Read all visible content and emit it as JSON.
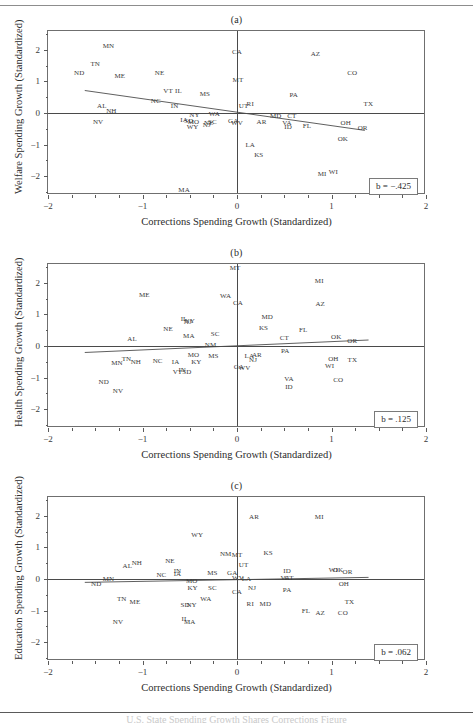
{
  "figure": {
    "x_axis_title": "Corrections Spending Growth (Standardized)",
    "x_ticks": [
      "-2",
      "-1",
      "0",
      "1",
      "2"
    ],
    "y_ticks": [
      "2",
      "1",
      "0",
      "-1",
      "-2"
    ],
    "footer_text": "U.S. State Spending Growth Shares Corrections Figure"
  },
  "chart_data": [
    {
      "type": "scatter",
      "panel": "a",
      "title": "(a)",
      "xlabel": "Corrections Spending Growth (Standardized)",
      "ylabel": "Welfare Spending Growth (Standardized)",
      "xlim": [
        -2,
        2
      ],
      "ylim": [
        -2.6,
        2.6
      ],
      "grid": false,
      "annotation": "b = -.425",
      "slope": -0.425,
      "intercept": -0.09,
      "fit_x": [
        -1.62,
        1.38
      ],
      "fit_y": [
        0.69,
        -0.59
      ],
      "point_labels": [
        "MN",
        "TN",
        "ND",
        "ME",
        "NE",
        "CA",
        "AZ",
        "CO",
        "MT",
        "VT",
        "IL",
        "MS",
        "PA",
        "TX",
        "NC",
        "UT",
        "RI",
        "AL",
        "IN",
        "NH",
        "NY",
        "WA",
        "MD",
        "CT",
        "NV",
        "IA",
        "SD",
        "MO",
        "NE2",
        "SC",
        "GA",
        "WV",
        "AR",
        "VA",
        "ID",
        "FL",
        "OH",
        "OR",
        "WY",
        "NJ",
        "OK",
        "LA",
        "KS",
        "MI",
        "WI",
        "MA"
      ],
      "points": [
        {
          "label": "MN",
          "x": -1.36,
          "y": 2.13
        },
        {
          "label": "TN",
          "x": -1.5,
          "y": 1.55
        },
        {
          "label": "ND",
          "x": -1.67,
          "y": 1.28
        },
        {
          "label": "ME",
          "x": -1.24,
          "y": 1.18
        },
        {
          "label": "NE",
          "x": -0.82,
          "y": 1.26
        },
        {
          "label": "CA",
          "x": 0.0,
          "y": 1.92
        },
        {
          "label": "AZ",
          "x": 0.83,
          "y": 1.88
        },
        {
          "label": "CO",
          "x": 1.22,
          "y": 1.28
        },
        {
          "label": "MT",
          "x": 0.01,
          "y": 1.06
        },
        {
          "label": "VT",
          "x": -0.73,
          "y": 0.7
        },
        {
          "label": "IL",
          "x": -0.62,
          "y": 0.7
        },
        {
          "label": "MS",
          "x": -0.34,
          "y": 0.6
        },
        {
          "label": "PA",
          "x": 0.6,
          "y": 0.56
        },
        {
          "label": "TX",
          "x": 1.39,
          "y": 0.28
        },
        {
          "label": "NC",
          "x": -0.86,
          "y": 0.37
        },
        {
          "label": "UT",
          "x": 0.07,
          "y": 0.22
        },
        {
          "label": "RI",
          "x": 0.14,
          "y": 0.27
        },
        {
          "label": "AL",
          "x": -1.43,
          "y": 0.21
        },
        {
          "label": "IN",
          "x": -0.66,
          "y": 0.23
        },
        {
          "label": "NH",
          "x": -1.33,
          "y": 0.06
        },
        {
          "label": "NY",
          "x": -0.45,
          "y": -0.05
        },
        {
          "label": "WA",
          "x": -0.24,
          "y": -0.02
        },
        {
          "label": "MD",
          "x": 0.41,
          "y": -0.08
        },
        {
          "label": "CT",
          "x": 0.58,
          "y": -0.09
        },
        {
          "label": "NV",
          "x": -1.47,
          "y": -0.29
        },
        {
          "label": "IA",
          "x": -0.56,
          "y": -0.22
        },
        {
          "label": "SD",
          "x": -0.51,
          "y": -0.26
        },
        {
          "label": "MO",
          "x": -0.46,
          "y": -0.27
        },
        {
          "label": "NE2",
          "x": -0.3,
          "y": -0.31
        },
        {
          "label": "SC",
          "x": -0.26,
          "y": -0.28
        },
        {
          "label": "GA",
          "x": -0.04,
          "y": -0.25
        },
        {
          "label": "WV",
          "x": 0.0,
          "y": -0.32
        },
        {
          "label": "AR",
          "x": 0.26,
          "y": -0.3
        },
        {
          "label": "VA",
          "x": 0.53,
          "y": -0.32
        },
        {
          "label": "ID",
          "x": 0.54,
          "y": -0.43
        },
        {
          "label": "FL",
          "x": 0.74,
          "y": -0.4
        },
        {
          "label": "OH",
          "x": 1.15,
          "y": -0.32
        },
        {
          "label": "OR",
          "x": 1.33,
          "y": -0.48
        },
        {
          "label": "WY",
          "x": -0.47,
          "y": -0.43
        },
        {
          "label": "NJ",
          "x": -0.32,
          "y": -0.39
        },
        {
          "label": "OK",
          "x": 1.12,
          "y": -0.82
        },
        {
          "label": "LA",
          "x": 0.14,
          "y": -1.0
        },
        {
          "label": "KS",
          "x": 0.23,
          "y": -1.33
        },
        {
          "label": "MI",
          "x": 0.9,
          "y": -1.93
        },
        {
          "label": "WI",
          "x": 1.02,
          "y": -1.88
        },
        {
          "label": "MA",
          "x": -0.56,
          "y": -2.45
        }
      ]
    },
    {
      "type": "scatter",
      "panel": "b",
      "title": "(b)",
      "xlabel": "Corrections Spending Growth (Standardized)",
      "ylabel": "Health Spending Growth (Standardized)",
      "xlim": [
        -2,
        2
      ],
      "ylim": [
        -2.6,
        2.6
      ],
      "grid": false,
      "annotation": "b = .125",
      "slope": 0.125,
      "intercept": -0.02,
      "fit_x": [
        -1.62,
        1.42
      ],
      "fit_y": [
        -0.24,
        0.16
      ],
      "point_labels": [
        "MT",
        "MI",
        "ME",
        "WA",
        "CA",
        "AZ",
        "IL",
        "NY",
        "NJ",
        "MD",
        "NE",
        "KS",
        "FL",
        "MA",
        "SC",
        "CT",
        "OK",
        "OR",
        "AL",
        "NM",
        "PA",
        "MO",
        "MS",
        "LA",
        "AR",
        "NJ2",
        "MN",
        "TN",
        "NH",
        "NC",
        "IA",
        "KY",
        "OH",
        "TX",
        "GA",
        "WV",
        "WI",
        "VT",
        "IN",
        "SD",
        "VA",
        "CO",
        "ND",
        "ID",
        "NV"
      ],
      "points": [
        {
          "label": "MT",
          "x": -0.02,
          "y": 2.48
        },
        {
          "label": "MI",
          "x": 0.87,
          "y": 2.06
        },
        {
          "label": "ME",
          "x": -0.98,
          "y": 1.62
        },
        {
          "label": "WA",
          "x": -0.12,
          "y": 1.58
        },
        {
          "label": "CA",
          "x": 0.01,
          "y": 1.35
        },
        {
          "label": "AZ",
          "x": 0.88,
          "y": 1.32
        },
        {
          "label": "IL",
          "x": -0.56,
          "y": 0.87
        },
        {
          "label": "NY",
          "x": -0.5,
          "y": 0.8
        },
        {
          "label": "NJ",
          "x": -0.52,
          "y": 0.77
        },
        {
          "label": "MD",
          "x": 0.32,
          "y": 0.92
        },
        {
          "label": "NE",
          "x": -0.73,
          "y": 0.55
        },
        {
          "label": "KS",
          "x": 0.28,
          "y": 0.56
        },
        {
          "label": "FL",
          "x": 0.7,
          "y": 0.5
        },
        {
          "label": "MA",
          "x": -0.51,
          "y": 0.33
        },
        {
          "label": "SC",
          "x": -0.23,
          "y": 0.37
        },
        {
          "label": "CT",
          "x": 0.5,
          "y": 0.25
        },
        {
          "label": "OK",
          "x": 1.05,
          "y": 0.27
        },
        {
          "label": "OR",
          "x": 1.22,
          "y": 0.17
        },
        {
          "label": "AL",
          "x": -1.11,
          "y": 0.21
        },
        {
          "label": "NM",
          "x": -0.28,
          "y": 0.02
        },
        {
          "label": "PA",
          "x": 0.51,
          "y": -0.15
        },
        {
          "label": "MO",
          "x": -0.46,
          "y": -0.27
        },
        {
          "label": "MS",
          "x": -0.25,
          "y": -0.33
        },
        {
          "label": "LA",
          "x": 0.13,
          "y": -0.31
        },
        {
          "label": "AR",
          "x": 0.21,
          "y": -0.29
        },
        {
          "label": "NJ2",
          "x": 0.17,
          "y": -0.45
        },
        {
          "label": "MN",
          "x": -1.27,
          "y": -0.55
        },
        {
          "label": "TN",
          "x": -1.17,
          "y": -0.42
        },
        {
          "label": "NH",
          "x": -1.07,
          "y": -0.5
        },
        {
          "label": "NC",
          "x": -0.84,
          "y": -0.48
        },
        {
          "label": "IA",
          "x": -0.65,
          "y": -0.5
        },
        {
          "label": "KY",
          "x": -0.43,
          "y": -0.52
        },
        {
          "label": "OH",
          "x": 1.02,
          "y": -0.42
        },
        {
          "label": "TX",
          "x": 1.22,
          "y": -0.45
        },
        {
          "label": "GA",
          "x": 0.02,
          "y": -0.67
        },
        {
          "label": "WV",
          "x": 0.08,
          "y": -0.7
        },
        {
          "label": "WI",
          "x": 0.98,
          "y": -0.62
        },
        {
          "label": "VT",
          "x": -0.63,
          "y": -0.82
        },
        {
          "label": "IN",
          "x": -0.58,
          "y": -0.75
        },
        {
          "label": "SD",
          "x": -0.53,
          "y": -0.82
        },
        {
          "label": "VA",
          "x": 0.55,
          "y": -1.05
        },
        {
          "label": "CO",
          "x": 1.07,
          "y": -1.08
        },
        {
          "label": "ND",
          "x": -1.41,
          "y": -1.14
        },
        {
          "label": "ID",
          "x": 0.55,
          "y": -1.3
        },
        {
          "label": "NV",
          "x": -1.26,
          "y": -1.42
        }
      ]
    },
    {
      "type": "scatter",
      "panel": "c",
      "title": "(c)",
      "xlabel": "Corrections Spending Growth (Standardized)",
      "ylabel": "Education Spending Growth (Standardized)",
      "xlim": [
        -2,
        2
      ],
      "ylim": [
        -2.6,
        2.6
      ],
      "grid": false,
      "annotation": "b = .062",
      "slope": 0.062,
      "intercept": -0.04,
      "fit_x": [
        -1.62,
        1.42
      ],
      "fit_y": [
        -0.14,
        0.02
      ],
      "point_labels": [
        "AR",
        "MI",
        "WY",
        "NM",
        "MT",
        "KS",
        "AL",
        "NH",
        "NE",
        "UT",
        "ID",
        "WI",
        "OK",
        "OR",
        "NC",
        "IN",
        "IA",
        "MS",
        "GA",
        "MO",
        "WV",
        "LA",
        "VA",
        "CT",
        "OH",
        "MN",
        "ND",
        "KY",
        "SC",
        "NJ",
        "PA",
        "CA",
        "TN",
        "ME",
        "WA",
        "RI",
        "MD",
        "TX",
        "SD",
        "NY",
        "FL",
        "AZ",
        "CO",
        "NV",
        "IL",
        "MA"
      ],
      "points": [
        {
          "label": "AR",
          "x": 0.18,
          "y": 1.96
        },
        {
          "label": "MI",
          "x": 0.87,
          "y": 1.96
        },
        {
          "label": "WY",
          "x": -0.42,
          "y": 1.4
        },
        {
          "label": "NM",
          "x": -0.12,
          "y": 0.78
        },
        {
          "label": "MT",
          "x": 0.0,
          "y": 0.77
        },
        {
          "label": "KS",
          "x": 0.33,
          "y": 0.82
        },
        {
          "label": "AL",
          "x": -1.16,
          "y": 0.41
        },
        {
          "label": "NH",
          "x": -1.06,
          "y": 0.5
        },
        {
          "label": "NE",
          "x": -0.71,
          "y": 0.57
        },
        {
          "label": "UT",
          "x": 0.07,
          "y": 0.43
        },
        {
          "label": "ID",
          "x": 0.53,
          "y": 0.25
        },
        {
          "label": "WI",
          "x": 1.02,
          "y": 0.3
        },
        {
          "label": "OK",
          "x": 1.07,
          "y": 0.3
        },
        {
          "label": "OR",
          "x": 1.17,
          "y": 0.22
        },
        {
          "label": "NC",
          "x": -0.8,
          "y": 0.14
        },
        {
          "label": "IN",
          "x": -0.63,
          "y": 0.25
        },
        {
          "label": "IA",
          "x": -0.63,
          "y": 0.16
        },
        {
          "label": "MS",
          "x": -0.26,
          "y": 0.19
        },
        {
          "label": "GA",
          "x": -0.05,
          "y": 0.18
        },
        {
          "label": "MO",
          "x": -0.48,
          "y": -0.07
        },
        {
          "label": "WV",
          "x": 0.01,
          "y": 0.02
        },
        {
          "label": "LA",
          "x": 0.1,
          "y": 0.0
        },
        {
          "label": "VA",
          "x": 0.51,
          "y": 0.03
        },
        {
          "label": "CT",
          "x": 0.55,
          "y": 0.03
        },
        {
          "label": "OH",
          "x": 1.13,
          "y": -0.17
        },
        {
          "label": "MN",
          "x": -1.36,
          "y": 0.0
        },
        {
          "label": "ND",
          "x": -1.49,
          "y": -0.15
        },
        {
          "label": "KY",
          "x": -0.47,
          "y": -0.3
        },
        {
          "label": "SC",
          "x": -0.26,
          "y": -0.29
        },
        {
          "label": "NJ",
          "x": 0.16,
          "y": -0.27
        },
        {
          "label": "PA",
          "x": 0.53,
          "y": -0.36
        },
        {
          "label": "CA",
          "x": 0.0,
          "y": -0.42
        },
        {
          "label": "TN",
          "x": -1.22,
          "y": -0.64
        },
        {
          "label": "ME",
          "x": -1.08,
          "y": -0.74
        },
        {
          "label": "WA",
          "x": -0.33,
          "y": -0.62
        },
        {
          "label": "RI",
          "x": 0.14,
          "y": -0.78
        },
        {
          "label": "MD",
          "x": 0.3,
          "y": -0.8
        },
        {
          "label": "TX",
          "x": 1.19,
          "y": -0.72
        },
        {
          "label": "SD",
          "x": -0.55,
          "y": -0.82
        },
        {
          "label": "NY",
          "x": -0.48,
          "y": -0.82
        },
        {
          "label": "FL",
          "x": 0.73,
          "y": -1.02
        },
        {
          "label": "AZ",
          "x": 0.88,
          "y": -1.08
        },
        {
          "label": "CO",
          "x": 1.12,
          "y": -1.08
        },
        {
          "label": "NV",
          "x": -1.26,
          "y": -1.35
        },
        {
          "label": "IL",
          "x": -0.55,
          "y": -1.28
        },
        {
          "label": "MA",
          "x": -0.5,
          "y": -1.36
        }
      ]
    }
  ]
}
